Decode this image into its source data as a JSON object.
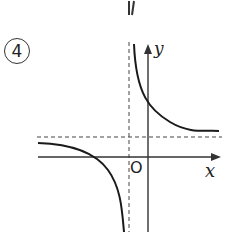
{
  "figure": {
    "number_label": "4",
    "axis_labels": {
      "x": "x",
      "y": "y",
      "origin": "O"
    },
    "colors": {
      "curve": "#1a1a1a",
      "axis": "#333333",
      "asymptote": "#444444"
    }
  }
}
